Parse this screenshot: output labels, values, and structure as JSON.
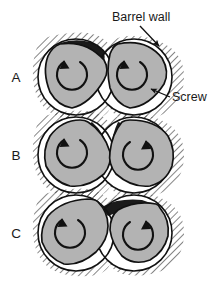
{
  "figure": {
    "type": "technical-diagram",
    "background_color": "#ffffff",
    "stroke_color": "#111111"
  },
  "annotations": [
    {
      "id": "barrel-wall",
      "label": "Barrel wall",
      "text_x": 112,
      "text_y": 21,
      "leader_from": [
        140,
        25
      ],
      "leader_to": [
        160,
        48
      ],
      "arrow": true
    },
    {
      "id": "screw",
      "label": "Screw",
      "text_x": 172,
      "text_y": 101,
      "leader_from": [
        170,
        97
      ],
      "leader_to": [
        150,
        88
      ],
      "arrow": true
    }
  ],
  "rows": [
    {
      "id": "row-a",
      "label": "A",
      "label_x": 16,
      "label_y": 77,
      "center_y": 77,
      "description": "Screw lobes rotated so black melt pools sit at the upper-left of each bore",
      "left_screw": {
        "rotation": "counterclockwise",
        "phase_deg": -18,
        "arrow_head": "top-left"
      },
      "right_screw": {
        "rotation": "counterclockwise",
        "phase_deg": -10,
        "arrow_head": "top-left"
      },
      "melt_pockets": [
        "upper-left-of-left-bore",
        "upper-left-of-right-bore"
      ]
    },
    {
      "id": "row-b",
      "label": "B",
      "label_x": 16,
      "label_y": 155,
      "center_y": 155,
      "description": "Screw lobes symmetric, black melt wedges meet at the intermeshing nip",
      "left_screw": {
        "rotation": "counterclockwise",
        "phase_deg": 0,
        "arrow_head": "top-left"
      },
      "right_screw": {
        "rotation": "clockwise",
        "phase_deg": 0,
        "arrow_head": "right"
      },
      "melt_pockets": [
        "upper-right-of-left-bore",
        "upper-left-of-right-bore"
      ]
    },
    {
      "id": "row-c",
      "label": "C",
      "label_x": 16,
      "label_y": 233,
      "center_y": 233,
      "description": "Screw lobes rotated the other way, black melt pool spans the top of the right bore",
      "left_screw": {
        "rotation": "counterclockwise",
        "phase_deg": 16,
        "arrow_head": "left"
      },
      "right_screw": {
        "rotation": "clockwise",
        "phase_deg": 14,
        "arrow_head": "bottom-right"
      },
      "melt_pockets": [
        "top-of-right-bore"
      ]
    }
  ],
  "geometry": {
    "bore_radius": 38,
    "left_bore_cx": 76,
    "right_bore_cx": 134,
    "screw_radius": 33,
    "hatch_spacing": 5,
    "hatch_angle_deg": 45
  },
  "colors": {
    "screw_fill": "#b3b3b3",
    "melt_fill": "#1a1a1a",
    "bore_fill": "#ffffff",
    "outline": "#111111",
    "hatch": "#2b2b2b",
    "text": "#1a1a1a"
  }
}
